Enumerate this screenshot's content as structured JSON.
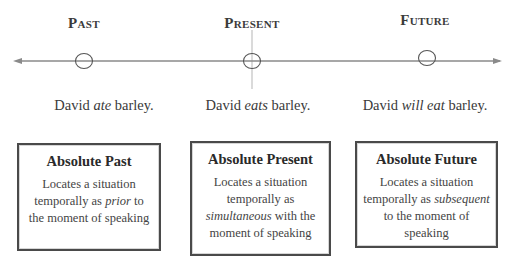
{
  "timeline": {
    "labels": [
      {
        "id": "past",
        "text": "Past"
      },
      {
        "id": "present",
        "text": "Present"
      },
      {
        "id": "future",
        "text": "Future"
      }
    ],
    "line_color": "#8a8a8a",
    "marker_color": "#555555"
  },
  "sentences": [
    {
      "before": "David ",
      "verb": "ate",
      "after": " barley."
    },
    {
      "before": "David ",
      "verb": "eats",
      "after": " barley."
    },
    {
      "before": "David ",
      "verb": "will eat",
      "after": " barley."
    }
  ],
  "boxes": [
    {
      "title": "Absolute Past",
      "line1": "Locates a situation",
      "line2_before": "temporally as ",
      "line2_em": "prior",
      "line2_after": " to",
      "line3": "the moment of speaking"
    },
    {
      "title": "Absolute Present",
      "line1": "Locates a situation",
      "line2": "temporally as",
      "line3_em": "simultaneous",
      "line3_after": " with the",
      "line4": "moment of speaking"
    },
    {
      "title": "Absolute Future",
      "line1": "Locates a situation",
      "line2_before": "temporally as ",
      "line2_em": "subsequent",
      "line3": "to the moment of",
      "line4": "speaking"
    }
  ]
}
